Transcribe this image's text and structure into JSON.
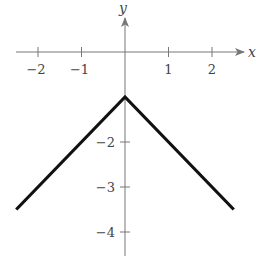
{
  "chart_data": {
    "type": "line",
    "title": "",
    "function": "y = -|x| - 1",
    "xlabel": "x",
    "ylabel": "y",
    "xlim": [
      -2.6,
      2.6
    ],
    "ylim": [
      -4.5,
      0.7
    ],
    "grid": false,
    "legend": null,
    "x_ticks": [
      -2,
      -1,
      1,
      2
    ],
    "x_tick_labels": [
      "−2",
      "−1",
      "1",
      "2"
    ],
    "y_ticks": [
      -2,
      -3,
      -4
    ],
    "y_tick_labels": [
      "−2",
      "−3",
      "−4"
    ],
    "series": [
      {
        "name": "f(x)",
        "color": "#111111",
        "x": [
          -2.5,
          0,
          2.5
        ],
        "y": [
          -3.5,
          -1,
          -3.5
        ]
      }
    ]
  },
  "layout": {
    "origin_px": [
      125,
      52
    ],
    "unit_x_px": 43.5,
    "unit_y_px": 45,
    "x_axis_px": [
      16,
      244
    ],
    "y_axis_px": [
      18,
      256
    ]
  }
}
